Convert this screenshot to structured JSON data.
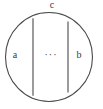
{
  "figure": {
    "type": "geometric-diagram",
    "background_color": "#ffffff",
    "stroke_color": "#4a4a4a",
    "text_color": "#3a3a3a",
    "shapes": {
      "circle": {
        "name": "outer-circle",
        "cx": 49,
        "cy": 57,
        "rx": 44,
        "ry": 45
      },
      "chords": [
        {
          "name": "left-chord",
          "x": 33,
          "y_top": 18,
          "y_bottom": 96
        },
        {
          "name": "right-chord",
          "x": 68,
          "y_top": 22,
          "y_bottom": 92
        }
      ]
    },
    "labels": {
      "top": "c",
      "left": "a",
      "right": "b",
      "center": "···"
    }
  }
}
